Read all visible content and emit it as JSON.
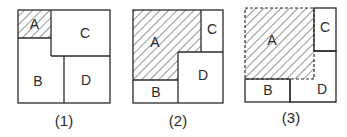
{
  "figure": {
    "panels": [
      {
        "caption": "(1)",
        "regions": {
          "A": "A",
          "B": "B",
          "C": "C",
          "D": "D"
        },
        "shaded": "A",
        "shaded_border": "solid"
      },
      {
        "caption": "(2)",
        "regions": {
          "A": "A",
          "B": "B",
          "C": "C",
          "D": "D"
        },
        "shaded": "A",
        "shaded_border": "solid"
      },
      {
        "caption": "(3)",
        "regions": {
          "A": "A",
          "B": "B",
          "C": "C",
          "D": "D"
        },
        "shaded": "A",
        "shaded_border": "dashed"
      }
    ],
    "colors": {
      "line": "#2a2a2a",
      "hatch": "#3a3a3a",
      "background": "#ffffff"
    }
  }
}
